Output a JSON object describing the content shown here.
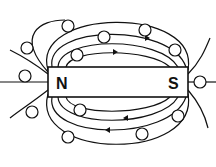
{
  "diagram": {
    "magnet": {
      "north_label": "N",
      "south_label": "S"
    },
    "compass_labels": {
      "north": "N",
      "south": "S"
    },
    "colors": {
      "ink": "#111111",
      "background": "#ffffff"
    }
  }
}
